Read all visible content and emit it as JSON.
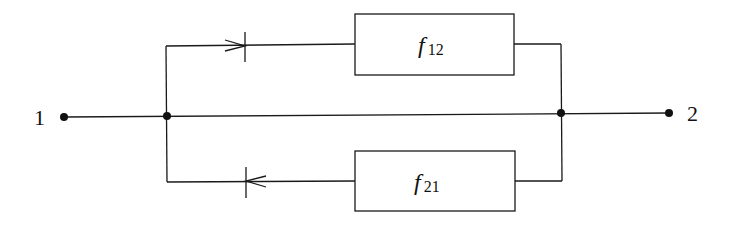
{
  "diagram": {
    "type": "signal-flow / parallel branch network",
    "nodes": [
      {
        "id": "1",
        "label": "1"
      },
      {
        "id": "2",
        "label": "2"
      }
    ],
    "blocks": [
      {
        "id": "f12",
        "symbol": "f",
        "subscript": "12",
        "direction": "forward (1 to 2)"
      },
      {
        "id": "f21",
        "symbol": "f",
        "subscript": "21",
        "direction": "reverse (2 to 1)"
      }
    ],
    "edges": [
      {
        "from": "1",
        "to": "2",
        "via": "direct wire"
      },
      {
        "from": "1",
        "to": "2",
        "via": "f12",
        "arrow": "right"
      },
      {
        "from": "2",
        "to": "1",
        "via": "f21",
        "arrow": "left"
      }
    ]
  }
}
